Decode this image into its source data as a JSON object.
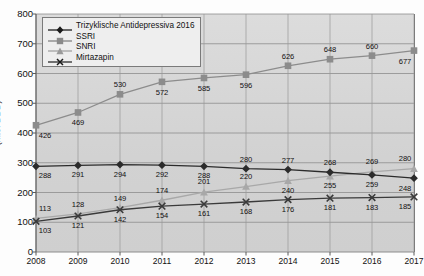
{
  "chart_data": {
    "type": "line",
    "title": "",
    "xlabel": "",
    "ylabel": "(Mio. DDD)",
    "categories": [
      "2008",
      "2009",
      "2010",
      "2011",
      "2012",
      "2013",
      "2014",
      "2015",
      "2016",
      "2017"
    ],
    "x": [
      2008,
      2009,
      2010,
      2011,
      2012,
      2013,
      2014,
      2015,
      2016,
      2017
    ],
    "ylim": [
      0,
      800
    ],
    "yticks": [
      0,
      100,
      200,
      300,
      400,
      500,
      600,
      700,
      800
    ],
    "grid": true,
    "legend_position": "top-left",
    "series": [
      {
        "name": "Trizyklische Antidepressiva 2016",
        "marker": "diamond",
        "color": "#2b2b2b",
        "values": [
          288,
          291,
          294,
          292,
          288,
          280,
          277,
          268,
          259,
          248
        ]
      },
      {
        "name": "SSRI",
        "marker": "square",
        "color": "#8c8c8c",
        "values": [
          426,
          469,
          530,
          572,
          585,
          596,
          626,
          648,
          660,
          677
        ]
      },
      {
        "name": "SNRI",
        "marker": "triangle",
        "color": "#a8a8a8",
        "values": [
          113,
          128,
          149,
          174,
          201,
          220,
          240,
          255,
          269,
          280
        ]
      },
      {
        "name": "Mirtazapin",
        "marker": "x",
        "color": "#3a3a3a",
        "values": [
          103,
          121,
          142,
          154,
          161,
          168,
          176,
          181,
          183,
          185
        ]
      }
    ]
  },
  "axis": {
    "y_label": "(Mio. DDD)",
    "y_ticks": [
      "0",
      "100",
      "200",
      "300",
      "400",
      "500",
      "600",
      "700",
      "800"
    ],
    "x_ticks": [
      "2008",
      "2009",
      "2010",
      "2011",
      "2012",
      "2013",
      "2014",
      "2015",
      "2016",
      "2017"
    ]
  },
  "legend": {
    "items": [
      {
        "label": "Trizyklische Antidepressiva 2016",
        "marker": "diamond"
      },
      {
        "label": "SSRI",
        "marker": "square"
      },
      {
        "label": "SNRI",
        "marker": "triangle"
      },
      {
        "label": "Mirtazapin",
        "marker": "x"
      }
    ]
  },
  "colors": {
    "plot_background": "#d6d6d6",
    "grid": "#8d8d8d",
    "axis": "#5a5a5a",
    "tca": "#2b2b2b",
    "ssri": "#8c8c8c",
    "snri": "#a8a8a8",
    "mirtazapin": "#3a3a3a"
  }
}
